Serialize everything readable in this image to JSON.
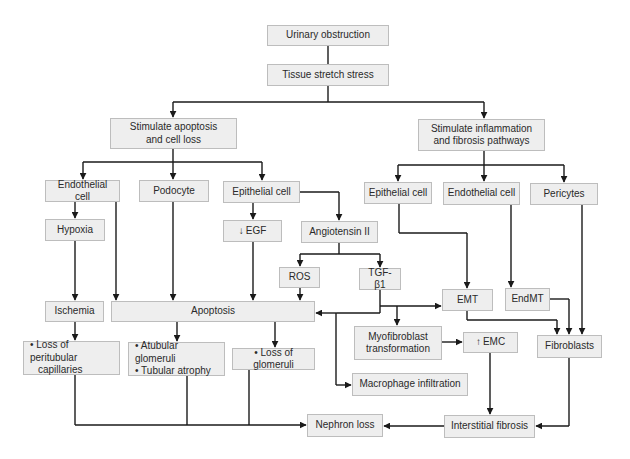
{
  "diagram": {
    "type": "flowchart",
    "nodes": {
      "urinary_obstruction": "Urinary obstruction",
      "tissue_stretch": "Tissue stretch stress",
      "stim_apoptosis": [
        "Stimulate apoptosis",
        "and cell loss"
      ],
      "stim_inflammation": [
        "Stimulate inflammation",
        "and fibrosis pathways"
      ],
      "endothelial_left": "Endothelial cell",
      "podocyte": "Podocyte",
      "epithelial_left": "Epithelial cell",
      "epithelial_right": "Epithelial cell",
      "endothelial_right": "Endothelial cell",
      "pericytes": "Pericytes",
      "hypoxia": "Hypoxia",
      "egf": {
        "arrow": "↓",
        "label": "EGF"
      },
      "angiotensin": "Angiotensin II",
      "ros": "ROS",
      "tgf": "TGF-β1",
      "ischemia": "Ischemia",
      "apoptosis": "Apoptosis",
      "emt": "EMT",
      "endmt": "EndMT",
      "fibroblasts": "Fibroblasts",
      "myofibroblast": [
        "Myofibroblast",
        "transformation"
      ],
      "emc": {
        "arrow": "↑",
        "label": "EMC"
      },
      "macrophage": "Macrophage infiltration",
      "loss_peritubular": [
        "• Loss of peritubular",
        "capillaries"
      ],
      "atubular": [
        "• Atubular glomeruli",
        "• Tubular atrophy"
      ],
      "loss_glomeruli": "• Loss of glomeruli",
      "nephron_loss": "Nephron loss",
      "interstitial_fibrosis": "Interstitial fibrosis"
    },
    "edges": [
      [
        "Urinary obstruction",
        "Tissue stretch stress"
      ],
      [
        "Tissue stretch stress",
        "Stimulate apoptosis and cell loss"
      ],
      [
        "Tissue stretch stress",
        "Stimulate inflammation and fibrosis pathways"
      ],
      [
        "Stimulate apoptosis and cell loss",
        "Endothelial cell"
      ],
      [
        "Stimulate apoptosis and cell loss",
        "Podocyte"
      ],
      [
        "Stimulate apoptosis and cell loss",
        "Epithelial cell"
      ],
      [
        "Endothelial cell",
        "Hypoxia"
      ],
      [
        "Endothelial cell",
        "Apoptosis"
      ],
      [
        "Hypoxia",
        "Ischemia"
      ],
      [
        "Podocyte",
        "Apoptosis"
      ],
      [
        "Epithelial cell",
        "↓EGF"
      ],
      [
        "Epithelial cell",
        "Angiotensin II"
      ],
      [
        "↓EGF",
        "Apoptosis"
      ],
      [
        "Angiotensin II",
        "ROS"
      ],
      [
        "Angiotensin II",
        "TGF-β1"
      ],
      [
        "ROS",
        "Apoptosis"
      ],
      [
        "TGF-β1",
        "Apoptosis"
      ],
      [
        "TGF-β1",
        "EMT"
      ],
      [
        "TGF-β1",
        "Myofibroblast transformation"
      ],
      [
        "TGF-β1",
        "Macrophage infiltration"
      ],
      [
        "Ischemia",
        "Loss of peritubular capillaries"
      ],
      [
        "Apoptosis",
        "Atubular glomeruli / Tubular atrophy"
      ],
      [
        "Apoptosis",
        "Loss of glomeruli"
      ],
      [
        "Stimulate inflammation and fibrosis pathways",
        "Epithelial cell (right)"
      ],
      [
        "Stimulate inflammation and fibrosis pathways",
        "Endothelial cell (right)"
      ],
      [
        "Stimulate inflammation and fibrosis pathways",
        "Pericytes"
      ],
      [
        "Epithelial cell (right)",
        "EMT"
      ],
      [
        "Endothelial cell (right)",
        "EndMT"
      ],
      [
        "Pericytes",
        "Fibroblasts"
      ],
      [
        "EMT",
        "Fibroblasts"
      ],
      [
        "EndMT",
        "Fibroblasts"
      ],
      [
        "Myofibroblast transformation",
        "↑EMC"
      ],
      [
        "↑EMC",
        "Interstitial fibrosis"
      ],
      [
        "Fibroblasts",
        "Interstitial fibrosis"
      ],
      [
        "Interstitial fibrosis",
        "Nephron loss"
      ],
      [
        "Loss of peritubular capillaries",
        "Nephron loss"
      ],
      [
        "Atubular glomeruli / Tubular atrophy",
        "Nephron loss"
      ],
      [
        "Loss of glomeruli",
        "Nephron loss"
      ]
    ]
  },
  "colors": {
    "box_fill": "#eeeeee",
    "box_border": "#bdbdbd",
    "line": "#1a1a1a",
    "text": "#2a2a2a"
  }
}
